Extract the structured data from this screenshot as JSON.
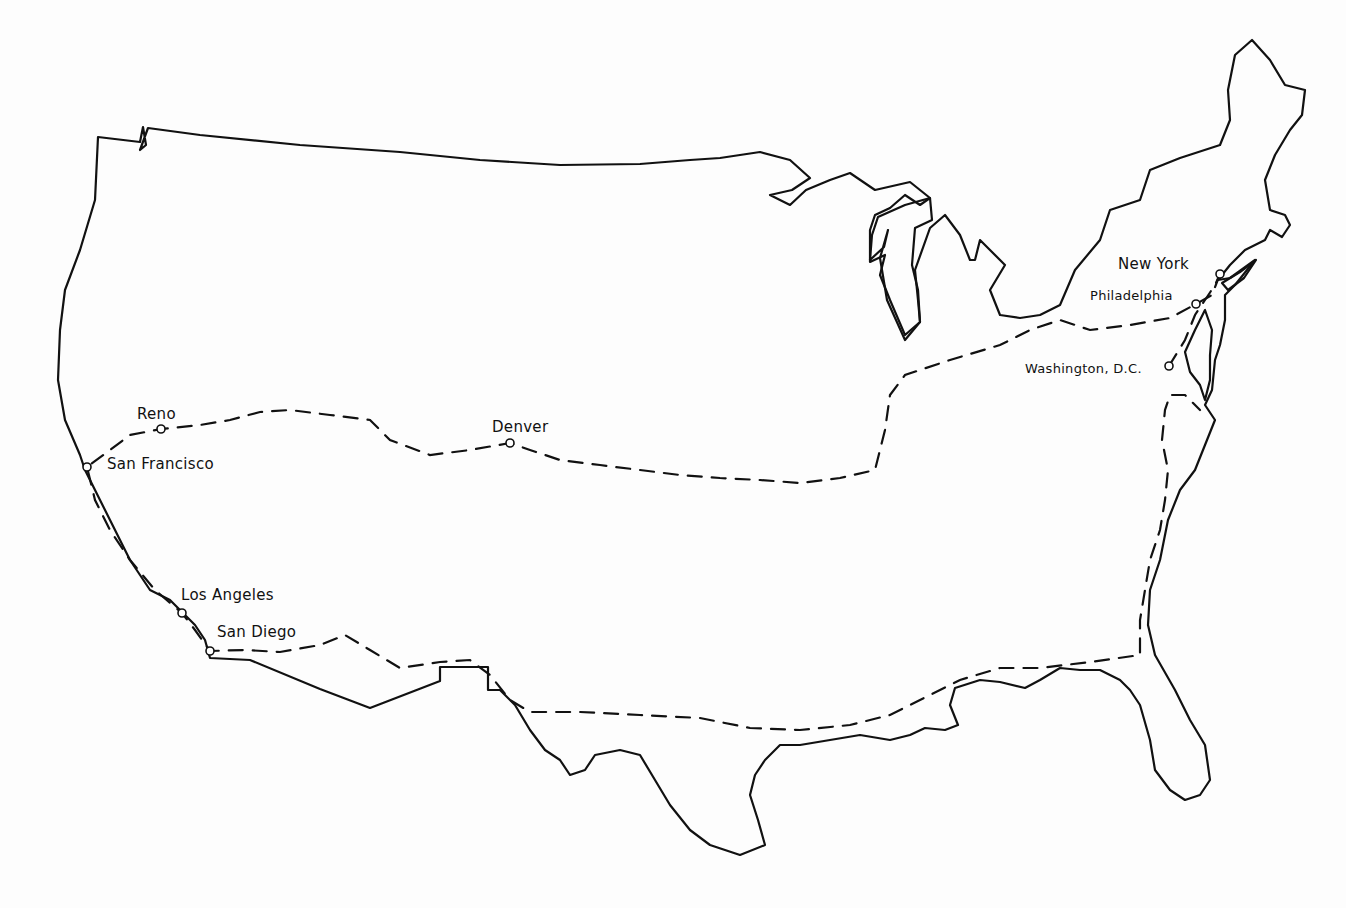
{
  "map": {
    "title": "",
    "style": {
      "line_color": "#111111",
      "background": "#fdfdfd"
    },
    "cities": [
      {
        "name": "New York",
        "x": 1220,
        "y": 274,
        "label_x": 1118,
        "label_y": 255
      },
      {
        "name": "Philadelphia",
        "x": 1196,
        "y": 304,
        "label_x": 1090,
        "label_y": 287
      },
      {
        "name": "Washington, D.C.",
        "x": 1169,
        "y": 366,
        "label_x": 1025,
        "label_y": 360
      },
      {
        "name": "Denver",
        "x": 510,
        "y": 443,
        "label_x": 492,
        "label_y": 418
      },
      {
        "name": "Reno",
        "x": 161,
        "y": 429,
        "label_x": 137,
        "label_y": 405
      },
      {
        "name": "San Francisco",
        "x": 87,
        "y": 467,
        "label_x": 107,
        "label_y": 455
      },
      {
        "name": "Los Angeles",
        "x": 182,
        "y": 613,
        "label_x": 181,
        "label_y": 586
      },
      {
        "name": "San Diego",
        "x": 210,
        "y": 651,
        "label_x": 217,
        "label_y": 623
      }
    ],
    "route": {
      "description": "Round trip: New York to Philadelphia to Washington D.C., west via Denver and Reno to San Francisco, south to Los Angeles and San Diego, east along the Gulf Coast, north along the Atlantic coast back to Washington and New York",
      "direction_arrows": true
    }
  }
}
